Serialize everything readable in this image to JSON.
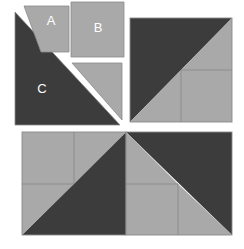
{
  "figure": {
    "canvas": {
      "width": 244,
      "height": 249
    },
    "colors": {
      "background": "#ffffff",
      "dark": "#3c3c3c",
      "light": "#a9a9a9",
      "outline": "#8a8a8a",
      "label_text": "#ffffff"
    },
    "labels": {
      "piece_a": "A",
      "piece_b": "B",
      "piece_c": "C"
    }
  },
  "pieces": {
    "a": {
      "name": "A",
      "shape": "trapezoid",
      "fill": "light",
      "points": "24,6 69,6 69,52 41,52",
      "label_x": 51,
      "label_y": 22
    },
    "b": {
      "name": "B",
      "shape": "square",
      "fill": "light",
      "points": "71,2 124,2 124,57 71,57",
      "label_x": 98,
      "label_y": 29
    },
    "c": {
      "name": "C",
      "shape": "right-triangle",
      "fill": "dark",
      "points": "15,12 15,125 120,125",
      "label_x": 42,
      "label_y": 90
    },
    "d": {
      "name": "small-triangle",
      "shape": "right-triangle",
      "fill": "light",
      "points": "72,63 122,63 122,120",
      "label_x": 0,
      "label_y": 0
    }
  },
  "assembly_top_right": {
    "name": "assembled-square-top-right",
    "bounds": {
      "x": 130,
      "y": 18,
      "width": 102,
      "height": 104
    },
    "regions": [
      {
        "name": "dark-upper-left-triangle",
        "fill": "dark",
        "points": "130,18 232,18 130,122"
      },
      {
        "name": "light-lower-left-triangle",
        "fill": "light",
        "points": "130,122 181,70 181,122"
      },
      {
        "name": "light-upper-right-triangle",
        "fill": "light",
        "points": "232,18 232,70 181,70"
      },
      {
        "name": "light-inner-square",
        "fill": "light",
        "points": "181,70 232,70 232,122 181,122"
      }
    ],
    "dividers": [
      {
        "name": "divider-vertical",
        "x1": 181,
        "y1": 70,
        "x2": 181,
        "y2": 122
      },
      {
        "name": "divider-horizontal",
        "x1": 181,
        "y1": 70,
        "x2": 232,
        "y2": 70
      }
    ]
  },
  "assembly_bottom_left": {
    "name": "assembled-square-bottom-left",
    "bounds": {
      "x": 22,
      "y": 132,
      "width": 104,
      "height": 103
    },
    "regions": [
      {
        "name": "dark-lower-right-triangle",
        "fill": "dark",
        "points": "22,235 126,132 126,235"
      },
      {
        "name": "light-upper-left-quadrant",
        "fill": "light",
        "points": "22,132 74,132 74,184 22,184"
      },
      {
        "name": "light-upper-right-triangle",
        "fill": "light",
        "points": "74,132 126,132 74,184"
      },
      {
        "name": "light-lower-left-triangle",
        "fill": "light",
        "points": "22,184 74,184 22,235"
      }
    ],
    "dividers": [
      {
        "name": "divider-vertical",
        "x1": 74,
        "y1": 132,
        "x2": 74,
        "y2": 184
      },
      {
        "name": "divider-horizontal",
        "x1": 22,
        "y1": 184,
        "x2": 74,
        "y2": 184
      }
    ]
  },
  "assembly_bottom_right": {
    "name": "assembled-square-bottom-right",
    "bounds": {
      "x": 126,
      "y": 132,
      "width": 106,
      "height": 103
    },
    "regions": [
      {
        "name": "dark-upper-right-triangle",
        "fill": "dark",
        "points": "126,132 232,132 232,235"
      },
      {
        "name": "light-upper-left-triangle",
        "fill": "light",
        "points": "126,132 126,184 178,184"
      },
      {
        "name": "light-lower-left-quadrant",
        "fill": "light",
        "points": "126,184 178,184 178,235 126,235"
      },
      {
        "name": "light-lower-right-triangle",
        "fill": "light",
        "points": "178,184 178,235 232,235"
      }
    ],
    "dividers": [
      {
        "name": "divider-vertical",
        "x1": 178,
        "y1": 184,
        "x2": 178,
        "y2": 235
      },
      {
        "name": "divider-horizontal",
        "x1": 126,
        "y1": 184,
        "x2": 178,
        "y2": 184
      }
    ]
  }
}
